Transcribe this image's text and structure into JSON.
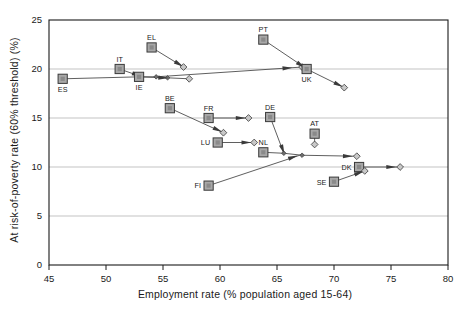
{
  "chart_data": {
    "type": "scatter",
    "title": "",
    "xlabel": "Employment rate (% population aged 15-64)",
    "ylabel": "At risk-of-poverty rate (60% threshold) (%)",
    "xlim": [
      45,
      80
    ],
    "ylim": [
      0,
      25
    ],
    "xticks": [
      "45",
      "50",
      "55",
      "60",
      "65",
      "70",
      "75",
      "80"
    ],
    "yticks": [
      "0",
      "5",
      "10",
      "15",
      "20",
      "25"
    ],
    "grid": "horizontal gridlines at y = 5, 10, 15, 20",
    "legend": "none",
    "marker_note": "Large grey square = country start value (labelled); small diamonds = trajectory waypoints; arrowheads indicate direction of change",
    "points": [
      {
        "code": "ES",
        "label_pos": "below",
        "x": 46.2,
        "y": 19.0,
        "path": [
          [
            46.2,
            19.0
          ],
          [
            52.9,
            19.2
          ],
          [
            55.4,
            19.1
          ],
          [
            57.3,
            19.0
          ]
        ],
        "arrow_at": [
          55.0,
          19.1
        ],
        "end_marker": "diamond"
      },
      {
        "code": "IT",
        "label_pos": "above",
        "x": 51.2,
        "y": 20.0,
        "path": [
          [
            51.2,
            20.0
          ],
          [
            52.9,
            19.3
          ]
        ],
        "arrow_at": [
          52.7,
          19.4
        ],
        "end_marker": "none"
      },
      {
        "code": "IE",
        "label_pos": "below",
        "x": 52.9,
        "y": 19.2,
        "path": [
          [
            52.9,
            19.2
          ],
          [
            54.4,
            19.2
          ],
          [
            67.2,
            20.2
          ]
        ],
        "arrow_at": [
          65.9,
          20.1
        ],
        "end_marker": "diamond"
      },
      {
        "code": "EL",
        "label_pos": "above",
        "x": 54.0,
        "y": 22.2,
        "path": [
          [
            54.0,
            22.2
          ],
          [
            56.8,
            20.2
          ]
        ],
        "arrow_at": [
          56.4,
          20.5
        ],
        "end_marker": "diamond"
      },
      {
        "code": "PT",
        "label_pos": "above",
        "x": 63.8,
        "y": 23.0,
        "path": [
          [
            63.8,
            23.0
          ],
          [
            67.5,
            20.1
          ]
        ],
        "arrow_at": [
          67.1,
          20.4
        ],
        "end_marker": "diamond"
      },
      {
        "code": "UK",
        "label_pos": "below",
        "x": 67.6,
        "y": 20.0,
        "path": [
          [
            67.6,
            20.0
          ],
          [
            70.9,
            18.1
          ]
        ],
        "arrow_at": [
          70.4,
          18.4
        ],
        "end_marker": "diamond"
      },
      {
        "code": "BE",
        "label_pos": "above",
        "x": 55.6,
        "y": 16.0,
        "path": [
          [
            55.6,
            16.0
          ],
          [
            60.3,
            13.5
          ]
        ],
        "arrow_at": [
          59.8,
          13.8
        ],
        "end_marker": "diamond"
      },
      {
        "code": "FR",
        "label_pos": "above",
        "x": 59.0,
        "y": 15.0,
        "path": [
          [
            59.0,
            15.0
          ],
          [
            62.5,
            15.0
          ]
        ],
        "arrow_at": [
          61.8,
          15.0
        ],
        "end_marker": "diamond"
      },
      {
        "code": "DE",
        "label_pos": "above",
        "x": 64.4,
        "y": 15.1,
        "path": [
          [
            64.4,
            15.1
          ],
          [
            65.6,
            11.4
          ]
        ],
        "arrow_at": [
          65.5,
          11.8
        ],
        "end_marker": "none"
      },
      {
        "code": "LU",
        "label_pos": "left",
        "x": 59.8,
        "y": 12.5,
        "path": [
          [
            59.8,
            12.5
          ],
          [
            63.0,
            12.5
          ]
        ],
        "arrow_at": [
          62.3,
          12.5
        ],
        "end_marker": "diamond"
      },
      {
        "code": "AT",
        "label_pos": "above",
        "x": 68.3,
        "y": 13.4,
        "path": [
          [
            68.3,
            13.4
          ],
          [
            68.3,
            12.3
          ]
        ],
        "arrow_at": null,
        "end_marker": "diamond"
      },
      {
        "code": "NL",
        "label_pos": "above",
        "x": 63.8,
        "y": 11.5,
        "path": [
          [
            63.8,
            11.5
          ],
          [
            65.6,
            11.4
          ],
          [
            67.2,
            11.2
          ],
          [
            72.0,
            11.1
          ]
        ],
        "arrow_at": [
          71.2,
          11.1
        ],
        "end_marker": "diamond"
      },
      {
        "code": "FI",
        "label_pos": "left",
        "x": 59.0,
        "y": 8.1,
        "path": [
          [
            59.0,
            8.1
          ],
          [
            67.0,
            11.2
          ]
        ],
        "arrow_at": [
          66.4,
          11.0
        ],
        "end_marker": "none"
      },
      {
        "code": "DK",
        "label_pos": "left",
        "x": 72.2,
        "y": 10.0,
        "path": [
          [
            72.2,
            10.0
          ],
          [
            75.8,
            10.0
          ]
        ],
        "arrow_at": [
          75.0,
          10.0
        ],
        "end_marker": "diamond"
      },
      {
        "code": "SE",
        "label_pos": "left",
        "x": 70.0,
        "y": 8.5,
        "path": [
          [
            70.0,
            8.5
          ],
          [
            72.7,
            9.6
          ]
        ],
        "arrow_at": [
          72.2,
          9.4
        ],
        "end_marker": "diamond"
      }
    ]
  }
}
